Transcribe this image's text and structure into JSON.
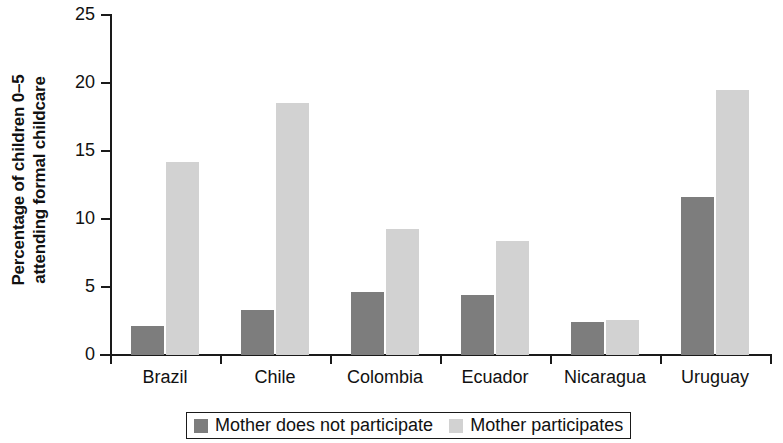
{
  "chart_data": {
    "type": "bar",
    "title": "",
    "xlabel": "",
    "ylabel_lines": [
      "Percentage of children 0–5",
      "attending formal childcare"
    ],
    "ylabel": "Percentage of children 0–5 attending formal childcare",
    "categories": [
      "Brazil",
      "Chile",
      "Colombia",
      "Ecuador",
      "Nicaragua",
      "Uruguay"
    ],
    "series": [
      {
        "name": "Mother does not participate",
        "color": "#7d7d7d",
        "values": [
          2.1,
          3.3,
          4.6,
          4.4,
          2.4,
          11.6
        ]
      },
      {
        "name": "Mother participates",
        "color": "#d2d2d2",
        "values": [
          14.2,
          18.5,
          9.3,
          8.4,
          2.6,
          19.5
        ]
      }
    ],
    "ylim": [
      0,
      25
    ],
    "ytick_values": [
      0,
      5,
      10,
      15,
      20,
      25
    ],
    "ytick_labels": [
      "0",
      "5",
      "10",
      "15",
      "20",
      "25"
    ],
    "grid": false,
    "legend_position": "bottom"
  },
  "legend": {
    "entries": [
      {
        "label": "Mother does not participate",
        "color": "#7d7d7d"
      },
      {
        "label": "Mother participates",
        "color": "#d2d2d2"
      }
    ]
  }
}
